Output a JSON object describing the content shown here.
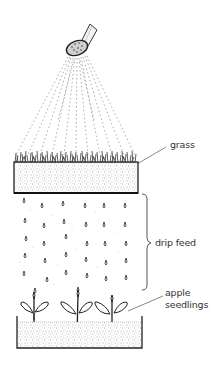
{
  "diagram": {
    "labels": {
      "grass": "grass",
      "drip_feed": "drip feed",
      "apple_seedlings_line1": "apple",
      "apple_seedlings_line2": "seedlings"
    },
    "components": [
      {
        "id": "watering-rose",
        "description": "watering can rose spraying water"
      },
      {
        "id": "spray",
        "description": "fine spray lines fanning downward"
      },
      {
        "id": "grass-tray",
        "description": "tray of soil with grass growing on top"
      },
      {
        "id": "drip-feed",
        "description": "water drops dripping from grass tray"
      },
      {
        "id": "seedling-tray",
        "description": "tray of soil with three apple seedlings"
      }
    ],
    "seedling_count": 3,
    "drip_columns": 6,
    "colors": {
      "ink": "#222222",
      "soil_dots": "#666666",
      "spray": "#888888",
      "label_text": "#333333"
    }
  }
}
